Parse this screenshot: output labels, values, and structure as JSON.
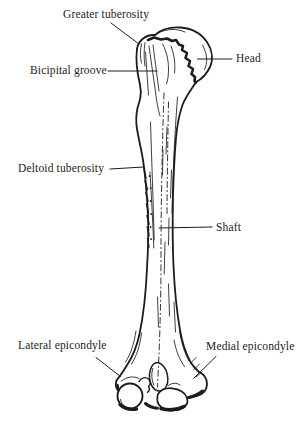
{
  "figure": {
    "background_color": "#ffffff",
    "ink_color": "#1c1c1c",
    "labels": {
      "greater_tuberosity": "Greater tuberosity",
      "bicipital_groove": "Bicipital groove",
      "head": "Head",
      "deltoid_tuberosity": "Deltoid tuberosity",
      "shaft": "Shaft",
      "lateral_epicondyle": "Lateral epicondyle",
      "medial_epicondyle": "Medial epicondyle"
    }
  }
}
